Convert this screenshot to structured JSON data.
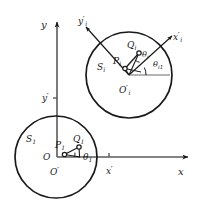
{
  "figure": {
    "background": "#ffffff",
    "stroke_color": "#1a1a1a",
    "width": 197,
    "height": 210
  },
  "axes": [
    {
      "name": "y-axis",
      "label": "y",
      "label_x": 41,
      "label_y": 20,
      "size": "sz10"
    },
    {
      "name": "x-axis",
      "label": "x",
      "label_x": 178,
      "label_y": 167,
      "size": "sz10"
    },
    {
      "name": "y-prime-axis",
      "label": "y",
      "prime": "′",
      "label_x": 42,
      "label_y": 94,
      "size": "sz9"
    },
    {
      "name": "x-prime-axis",
      "label": "x",
      "prime": "′",
      "label_x": 106,
      "label_y": 167,
      "size": "sz9"
    },
    {
      "name": "y-prime-i-axis",
      "label": "y",
      "prime": "′",
      "sub": "i",
      "label_x": 78,
      "label_y": 17,
      "size": "sz9"
    },
    {
      "name": "x-prime-i-axis",
      "label": "x",
      "prime": "′",
      "sub": "i",
      "label_x": 173,
      "label_y": 33,
      "size": "sz9"
    }
  ],
  "circles": [
    {
      "name": "circle-S1",
      "label": "S",
      "sub": "1",
      "cx": 56,
      "cy": 157,
      "r": 41,
      "label_x": 26,
      "label_y": 135
    },
    {
      "name": "circle-Si",
      "label": "S",
      "sub": "i",
      "cx": 129,
      "cy": 75,
      "r": 43,
      "label_x": 97,
      "label_y": 63
    }
  ],
  "points": [
    {
      "name": "origin-O",
      "label": "O",
      "px": 57,
      "py": 157,
      "label_x": 43,
      "label_y": 153,
      "size": "sz9",
      "marker": false
    },
    {
      "name": "origin-O-prime",
      "label": "O",
      "prime": "′",
      "px": 57,
      "py": 157,
      "label_x": 50,
      "label_y": 168,
      "size": "sz9",
      "marker": false
    },
    {
      "name": "origin-O-prime-i",
      "label": "O",
      "prime": "′",
      "sub": "i",
      "px": 129,
      "py": 75,
      "label_x": 119,
      "label_y": 86,
      "size": "sz9",
      "marker": false
    },
    {
      "name": "point-P1",
      "label": "P",
      "sub": "1",
      "px": 64.5,
      "py": 154.5,
      "label_x": 55,
      "label_y": 141,
      "size": "sz9",
      "marker": true
    },
    {
      "name": "point-Q1",
      "label": "Q",
      "sub": "1",
      "px": 79,
      "py": 147,
      "label_x": 73,
      "label_y": 135,
      "size": "sz9",
      "marker": true
    },
    {
      "name": "point-Pi",
      "label": "P",
      "sub": "i",
      "px": 125,
      "py": 68.5,
      "label_x": 113,
      "label_y": 57,
      "size": "sz9",
      "marker": true
    },
    {
      "name": "point-Qi",
      "label": "Q",
      "sub": "i",
      "px": 139,
      "py": 53,
      "label_x": 127,
      "label_y": 41,
      "size": "sz9",
      "marker": true
    }
  ],
  "angles": [
    {
      "name": "angle-theta-1",
      "label": "θ",
      "sub": "1",
      "label_x": 83,
      "label_y": 153,
      "size": "sz9"
    },
    {
      "name": "angle-theta-i",
      "label": "θ",
      "sub": "i",
      "label_x": 142,
      "label_y": 51,
      "size": "sz8"
    },
    {
      "name": "angle-theta-i1",
      "label": "θ",
      "sub": "i1",
      "label_x": 153,
      "label_y": 61,
      "size": "sz8"
    }
  ]
}
